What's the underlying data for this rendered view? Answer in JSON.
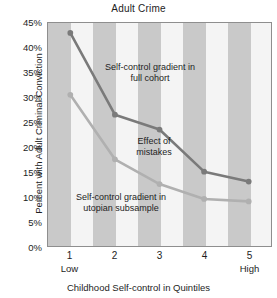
{
  "chart_data": {
    "type": "line",
    "title": "Adult Crime",
    "xlabel": "Childhood Self-control in Quintiles",
    "ylabel": "Percent with Adult Criminal Conviction",
    "categories": [
      "1",
      "2",
      "3",
      "4",
      "5"
    ],
    "x_endcaps": {
      "low": "Low",
      "high": "High"
    },
    "ylim": [
      0,
      45
    ],
    "ytick_labels": [
      "0%",
      "5%",
      "10%",
      "15%",
      "20%",
      "25%",
      "30%",
      "35%",
      "40%",
      "45%"
    ],
    "ytick_values": [
      0,
      5,
      10,
      15,
      20,
      25,
      30,
      35,
      40,
      45
    ],
    "grid": false,
    "legend_position": "inline-annotations",
    "background": "alternating vertical gray and white bands",
    "series": [
      {
        "name": "Self-control gradient in full cohort",
        "color": "#7a7a7a",
        "values": [
          43.0,
          26.5,
          23.5,
          15.0,
          13.0
        ]
      },
      {
        "name": "Self-control gradient in utopian subsample",
        "color": "#b0b0b0",
        "values": [
          30.5,
          17.5,
          12.5,
          9.5,
          9.0
        ]
      }
    ],
    "annotations": [
      {
        "text": "Self-control gradient in\nfull cohort"
      },
      {
        "text": "Effect of\nmistakes"
      },
      {
        "text": "Self-control gradient in\nutopian subsample"
      }
    ]
  },
  "colors": {
    "plot_border": "#8e8e8e",
    "stripe_dark": "#c9c9c9",
    "stripe_light": "#f4f4f4",
    "series_dark": "#7a7a7a",
    "series_light": "#b0b0b0",
    "text": "#1d1d1d"
  }
}
